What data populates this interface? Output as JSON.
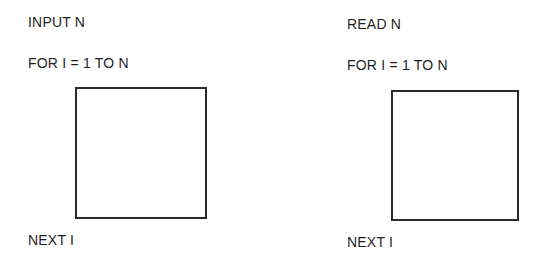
{
  "diagrams": [
    {
      "name": "input-loop",
      "header": "INPUT N",
      "loop_start": "FOR I = 1 TO N",
      "loop_body": "",
      "loop_end": "NEXT I"
    },
    {
      "name": "read-loop",
      "header": "READ N",
      "loop_start": "FOR I = 1 TO N",
      "loop_body": "",
      "loop_end": "NEXT I"
    }
  ]
}
